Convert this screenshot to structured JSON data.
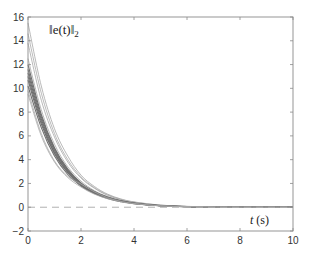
{
  "chart_data": {
    "type": "line",
    "title": "",
    "xlabel": "t (s)",
    "ylabel": "‖e(t)‖₂",
    "xlim": [
      0,
      10
    ],
    "ylim": [
      -2,
      16
    ],
    "xticks": [
      0,
      2,
      4,
      6,
      8,
      10
    ],
    "yticks": [
      -2,
      0,
      2,
      4,
      6,
      8,
      10,
      12,
      14,
      16
    ],
    "grid": false,
    "legend": null,
    "reference_line": {
      "y": 0,
      "style": "dashed",
      "color": "#b0b0b0"
    },
    "series_color": "#7a7a7a",
    "x": [
      0,
      0.5,
      1,
      1.5,
      2,
      2.5,
      3,
      3.5,
      4,
      5,
      6,
      7,
      8,
      10
    ],
    "series": [
      {
        "name": "run 1",
        "values": [
          15.5,
          10.2,
          6.6,
          4.3,
          2.7,
          1.75,
          1.1,
          0.7,
          0.45,
          0.18,
          0.07,
          0.03,
          0.01,
          0.0
        ]
      },
      {
        "name": "run 2",
        "values": [
          14.6,
          9.6,
          6.2,
          4.0,
          2.55,
          1.65,
          1.05,
          0.67,
          0.43,
          0.17,
          0.07,
          0.03,
          0.01,
          0.0
        ]
      },
      {
        "name": "run 3",
        "values": [
          13.8,
          9.0,
          5.9,
          3.8,
          2.45,
          1.6,
          1.0,
          0.64,
          0.41,
          0.16,
          0.06,
          0.02,
          0.01,
          0.0
        ]
      },
      {
        "name": "run 4",
        "values": [
          12.5,
          8.2,
          5.3,
          3.4,
          2.2,
          1.4,
          0.9,
          0.58,
          0.37,
          0.15,
          0.06,
          0.02,
          0.01,
          0.0
        ]
      },
      {
        "name": "run 5",
        "values": [
          12.0,
          7.8,
          5.0,
          3.2,
          2.05,
          1.33,
          0.85,
          0.55,
          0.35,
          0.14,
          0.05,
          0.02,
          0.01,
          0.0
        ]
      },
      {
        "name": "run 6",
        "values": [
          11.6,
          7.6,
          4.9,
          3.1,
          2.0,
          1.3,
          0.83,
          0.53,
          0.34,
          0.13,
          0.05,
          0.02,
          0.01,
          0.0
        ]
      },
      {
        "name": "run 7",
        "values": [
          11.3,
          7.4,
          4.75,
          3.05,
          1.95,
          1.27,
          0.81,
          0.52,
          0.33,
          0.13,
          0.05,
          0.02,
          0.01,
          0.0
        ]
      },
      {
        "name": "run 8",
        "values": [
          11.0,
          7.2,
          4.6,
          2.95,
          1.9,
          1.23,
          0.79,
          0.5,
          0.32,
          0.12,
          0.05,
          0.02,
          0.01,
          0.0
        ]
      },
      {
        "name": "run 9",
        "values": [
          10.7,
          7.0,
          4.5,
          2.9,
          1.85,
          1.2,
          0.77,
          0.49,
          0.31,
          0.12,
          0.05,
          0.02,
          0.01,
          0.0
        ]
      },
      {
        "name": "run 10",
        "values": [
          10.2,
          6.7,
          4.3,
          2.75,
          1.78,
          1.15,
          0.74,
          0.47,
          0.3,
          0.12,
          0.04,
          0.02,
          0.01,
          0.0
        ]
      },
      {
        "name": "run 11",
        "values": [
          9.8,
          6.2,
          3.9,
          2.6,
          1.95,
          1.3,
          0.8,
          0.5,
          0.32,
          0.12,
          0.05,
          0.02,
          0.01,
          0.0
        ]
      },
      {
        "name": "run 12",
        "values": [
          9.5,
          6.0,
          3.8,
          2.5,
          1.7,
          1.1,
          0.72,
          0.46,
          0.29,
          0.11,
          0.04,
          0.02,
          0.01,
          0.0
        ]
      }
    ]
  },
  "labels": {
    "y_main": "‖e(t)‖",
    "y_sub": "2",
    "x_main": "t",
    "x_unit": " (s)"
  }
}
